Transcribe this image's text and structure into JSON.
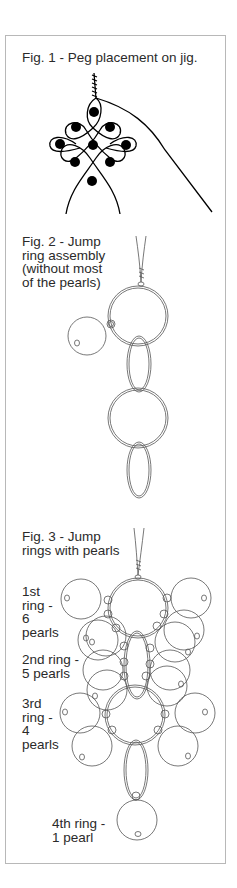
{
  "figures": [
    {
      "id": "fig1",
      "caption": "Fig. 1 - Peg placement on jig."
    },
    {
      "id": "fig2",
      "caption": "Fig. 2 - Jump\nring assembly\n(without most\nof the pearls)"
    },
    {
      "id": "fig3",
      "caption": "Fig. 3 - Jump\nrings with pearls",
      "ring_labels": [
        {
          "text": "1st\nring -\n6\npearls"
        },
        {
          "text": "2nd ring -\n5 pearls"
        },
        {
          "text": "3rd\nring -\n4\npearls"
        },
        {
          "text": "4th ring -\n1 pearl"
        }
      ]
    }
  ],
  "colors": {
    "line": "#333333",
    "light_line": "#555555",
    "border": "#b8b8b8",
    "peg": "#000000"
  }
}
